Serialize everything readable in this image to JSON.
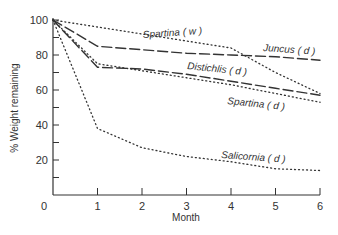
{
  "chart_data": {
    "type": "line",
    "title": "",
    "xlabel": "Month",
    "ylabel": "% Weight remaining",
    "xlim": [
      0,
      6
    ],
    "ylim": [
      0,
      100
    ],
    "x": [
      0,
      1,
      2,
      3,
      4,
      5,
      6
    ],
    "x_ticks": [
      "0",
      "1",
      "2",
      "3",
      "4",
      "5",
      "6"
    ],
    "y_ticks": [
      "20",
      "40",
      "60",
      "80",
      "100"
    ],
    "grid": false,
    "legend": "inline labels",
    "series": [
      {
        "name": "Spartina ( w )",
        "style": "dotted",
        "values": [
          100,
          96,
          92,
          88,
          84,
          70,
          58
        ]
      },
      {
        "name": "Juncus ( d )",
        "style": "long-dash",
        "values": [
          100,
          85,
          83,
          81,
          80,
          79,
          77
        ]
      },
      {
        "name": "Distichlis ( d )",
        "style": "long-dash",
        "values": [
          100,
          73,
          72,
          69,
          65,
          61,
          57
        ]
      },
      {
        "name": "Spartina ( d )",
        "style": "dotted",
        "values": [
          100,
          75,
          71,
          67,
          63,
          58,
          53
        ]
      },
      {
        "name": "Salicornia ( d )",
        "style": "dotted",
        "values": [
          100,
          38,
          27,
          22,
          19,
          15,
          14
        ]
      }
    ]
  }
}
